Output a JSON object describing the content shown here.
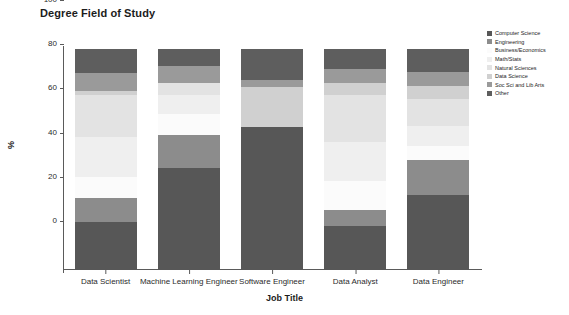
{
  "chart_data": {
    "type": "bar",
    "subtype": "stacked-percentage",
    "title": "Degree Field of Study",
    "xlabel": "Job Title",
    "ylabel": "%",
    "ylim": [
      0,
      100
    ],
    "yticks": [
      0,
      20,
      40,
      60,
      80,
      100
    ],
    "grid": false,
    "legend_position": "right",
    "categories": [
      "Data Scientist",
      "Machine Learning Engineer",
      "Software Engineer",
      "Data Analyst",
      "Data Engineer"
    ],
    "series": [
      {
        "name": "Computer Science",
        "color": "#575757",
        "values": [
          21.7,
          46.2,
          64.8,
          20.0,
          33.9
        ]
      },
      {
        "name": "Engineering",
        "color": "#8c8c8c",
        "values": [
          10.9,
          15.0,
          0.0,
          7.1,
          16.1
        ]
      },
      {
        "name": "Business/Economics",
        "color": "#fbfbfb",
        "values": [
          9.5,
          9.5,
          0.0,
          13.0,
          6.2
        ]
      },
      {
        "name": "Math/Stats",
        "color": "#efefef",
        "values": [
          18.1,
          8.6,
          0.0,
          18.0,
          9.0
        ]
      },
      {
        "name": "Natural Sciences",
        "color": "#e3e3e3",
        "values": [
          19.0,
          5.4,
          0.0,
          21.0,
          12.0
        ]
      },
      {
        "name": "Data Science",
        "color": "#d0d0d0",
        "values": [
          1.6,
          0.0,
          18.1,
          5.4,
          5.9
        ]
      },
      {
        "name": "Soc Sci and Lib Arts",
        "color": "#9a9a9a",
        "values": [
          8.2,
          7.7,
          3.2,
          6.5,
          6.4
        ]
      },
      {
        "name": "Other",
        "color": "#5e5e5e",
        "values": [
          11.0,
          7.6,
          13.9,
          9.0,
          10.5
        ]
      }
    ]
  },
  "axis": {
    "ytick_labels": [
      "0",
      "20",
      "40",
      "60",
      "80",
      "100"
    ]
  },
  "colors": {
    "axis": "#5a5a5a",
    "text": "#1c1c1c",
    "background": "#ffffff"
  }
}
